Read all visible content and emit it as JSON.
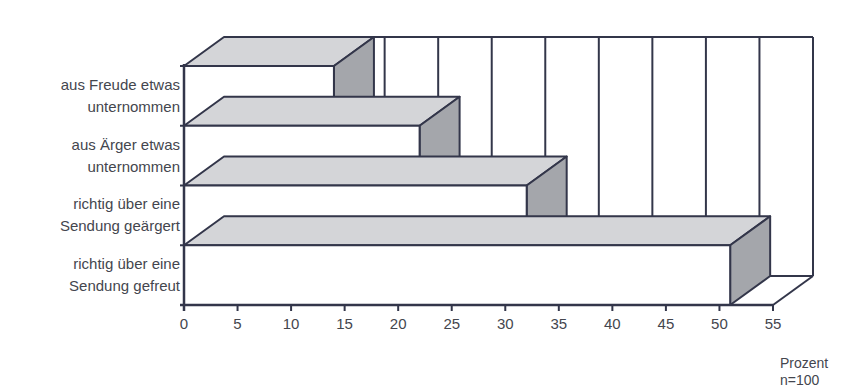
{
  "chart_data": {
    "type": "bar",
    "orientation": "horizontal",
    "style": "3d",
    "title": "",
    "categories": [
      "aus Freude etwas unternommen",
      "aus Ärger etwas unternommen",
      "richtig über eine Sendung geärgert",
      "richtig über eine Sendung gefreut"
    ],
    "category_label_lines": [
      [
        "aus Freude etwas",
        "unternommen"
      ],
      [
        "aus Ärger etwas",
        "unternommen"
      ],
      [
        "richtig über eine",
        "Sendung geärgert"
      ],
      [
        "richtig über eine",
        "Sendung gefreut"
      ]
    ],
    "values": [
      14,
      22,
      32,
      51
    ],
    "xlabel": "Prozent",
    "note": "n=100",
    "xlim": [
      0,
      55
    ],
    "xticks": [
      0,
      5,
      10,
      15,
      20,
      25,
      30,
      35,
      40,
      45,
      50,
      55
    ],
    "grid": true,
    "legend": null
  },
  "colors": {
    "front": "#ffffff",
    "top": "#d4d5d8",
    "side": "#a4a6ab",
    "stroke": "#33364a",
    "grid": "#33364a"
  },
  "axis": {
    "unit_label": "Prozent",
    "sample_label": "n=100"
  }
}
